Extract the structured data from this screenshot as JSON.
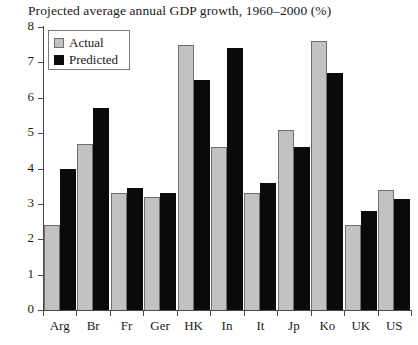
{
  "chart_data": {
    "type": "bar",
    "title": "Projected average annual GDP growth, 1960–2000 (%)",
    "xlabel": "",
    "ylabel": "",
    "ylim": [
      0,
      8
    ],
    "yticks": [
      "0",
      "1",
      "2",
      "3",
      "4",
      "5",
      "6",
      "7",
      "8"
    ],
    "grid": false,
    "legend_position": "top-left",
    "categories": [
      "Arg",
      "Br",
      "Fr",
      "Ger",
      "HK",
      "In",
      "It",
      "Jp",
      "Ko",
      "UK",
      "US"
    ],
    "series": [
      {
        "name": "Actual",
        "color": "#c2c2c2",
        "values": [
          2.4,
          4.7,
          3.3,
          3.2,
          7.5,
          4.6,
          3.3,
          5.1,
          7.6,
          2.4,
          3.4
        ]
      },
      {
        "name": "Predicted",
        "color": "#0a0a0a",
        "values": [
          4.0,
          5.7,
          3.45,
          3.3,
          6.5,
          7.4,
          3.6,
          4.6,
          6.7,
          2.8,
          3.15
        ]
      }
    ]
  },
  "legend": {
    "items": [
      {
        "label": "Actual",
        "swatch": "actual"
      },
      {
        "label": "Predicted",
        "swatch": "predicted"
      }
    ]
  }
}
